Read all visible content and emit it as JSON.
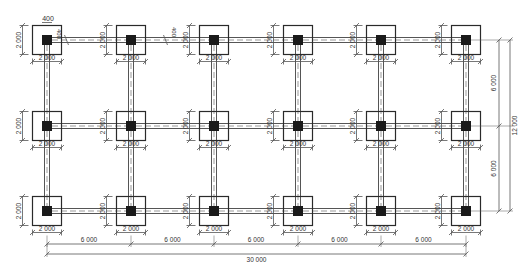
{
  "drawing": {
    "title": "Foundation plan: 6 x 3 grid of pad footings with tie beams",
    "colors": {
      "line": "#2a2a2a",
      "dim": "#555555",
      "column": "#1a1a1a",
      "background": "#ffffff"
    },
    "grid": {
      "col_x": [
        47,
        131,
        214,
        298,
        381,
        466
      ],
      "row_y": [
        40,
        126,
        211
      ]
    },
    "footing": {
      "size_px": 29,
      "column_px": 10,
      "width_label": "2 000",
      "height_label": "2 000"
    },
    "beam": {
      "gap_px": 5
    },
    "annotations": {
      "column_width_label": "400",
      "beam_width_label_1": "400",
      "beam_width_label_2": "400"
    },
    "bottom_dims": {
      "span_label": "6 000",
      "spans": [
        "6 000",
        "6 000",
        "6 000",
        "6 000",
        "6 000"
      ],
      "total_label": "30 000",
      "span_line_y": 244,
      "total_line_y": 254
    },
    "right_dims": {
      "spans": [
        "6 000",
        "6 000"
      ],
      "total_label": "12 000",
      "span_line_x": 499,
      "total_line_x": 510
    }
  }
}
